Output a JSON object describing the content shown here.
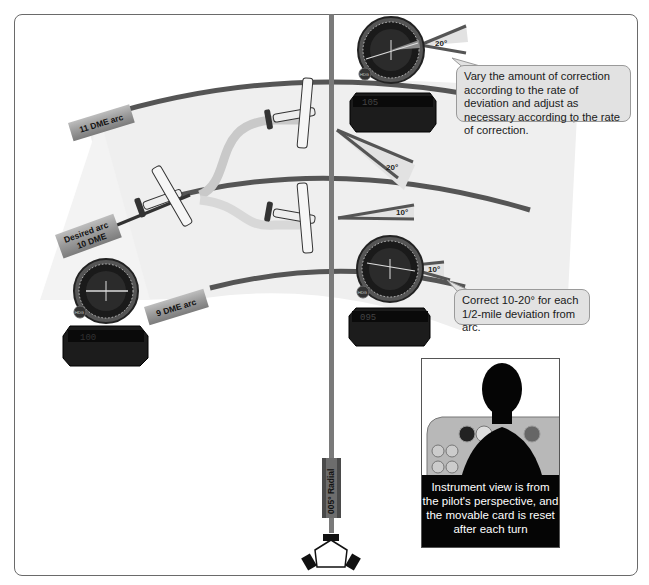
{
  "diagram": {
    "colors": {
      "arc": "#555555",
      "arc_region": "#efefef",
      "radial": "#7a7a7a",
      "label_tag": "#9a9a9a",
      "callout_bg": "#e2e2e2",
      "caption_bg": "#050505",
      "caption_text": "#ffffff"
    },
    "arc_labels": {
      "outer": "11 DME arc",
      "desired_line1": "Desired arc",
      "desired_line2": "10 DME",
      "inner": "9 DME arc"
    },
    "radial_label": "005° Radial",
    "angle_labels": {
      "top_instrument": "20°",
      "outer_correction": "20°",
      "inner_correction": "10°",
      "bottom_instrument": "10°"
    },
    "instruments": [
      {
        "id": "left",
        "hdg_label": "HDG",
        "dme_readout": "100"
      },
      {
        "id": "top",
        "hdg_label": "HDG",
        "dme_readout": "105"
      },
      {
        "id": "bottom-right",
        "hdg_label": "HDG",
        "dme_readout": "095"
      }
    ],
    "callouts": {
      "upper": "Vary the amount of correction according to the rate of deviation and adjust as necessary according to the rate of correction.",
      "lower": "Correct 10-20° for each 1/2-mile deviation from arc."
    },
    "pilot_caption": "Instrument view is from the pilot's perspective, and the movable card is reset after each turn"
  }
}
